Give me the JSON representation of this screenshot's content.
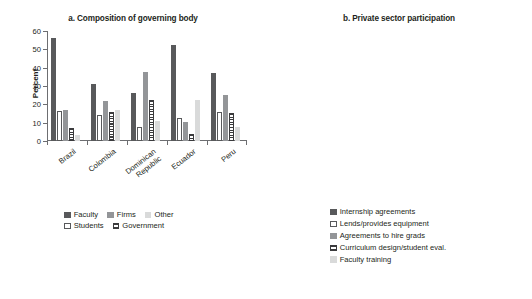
{
  "figure": {
    "panels": [
      {
        "id": "a",
        "title": "a. Composition of governing body",
        "ylabel": "Percent"
      },
      {
        "id": "b",
        "title": "b. Private sector participation",
        "ylabel": "Percent"
      }
    ]
  },
  "chart_data": [
    {
      "type": "bar",
      "title": "a. Composition of governing body",
      "xlabel": "",
      "ylabel": "Percent",
      "ylim": [
        0,
        60
      ],
      "yticks": [
        0,
        10,
        20,
        30,
        40,
        50,
        60
      ],
      "ytick_labels": [
        "0",
        "10",
        "20",
        "30",
        "40",
        "50",
        "60"
      ],
      "grid": false,
      "legend_position": "bottom",
      "categories": [
        "Brazil",
        "Colombia",
        "Dominican Republic",
        "Ecuador",
        "Peru"
      ],
      "category_lines": [
        [
          "Brazil"
        ],
        [
          "Colombia"
        ],
        [
          "Dominican",
          "Republic"
        ],
        [
          "Ecuador"
        ],
        [
          "Peru"
        ]
      ],
      "series": [
        {
          "name": "Faculty",
          "fill": "dark",
          "values": [
            56.0,
            31.0,
            26.0,
            52.2,
            37.0
          ]
        },
        {
          "name": "Students",
          "fill": "white",
          "values": [
            16.3,
            14.3,
            7.4,
            12.8,
            16.0
          ]
        },
        {
          "name": "Firms",
          "fill": "mid",
          "values": [
            16.9,
            22.0,
            37.8,
            10.4,
            25.2
          ]
        },
        {
          "name": "Government",
          "fill": "stripe",
          "values": [
            7.3,
            15.8,
            22.4,
            3.6,
            15.1
          ]
        },
        {
          "name": "Other",
          "fill": "light",
          "values": [
            3.5,
            16.7,
            11.0,
            22.2,
            7.7
          ]
        }
      ]
    },
    {
      "type": "bar",
      "title": "b. Private sector participation",
      "xlabel": "",
      "ylabel": "Percent",
      "ylim": [
        0,
        100
      ],
      "yticks": [
        0,
        20,
        40,
        60,
        80,
        100
      ],
      "ytick_labels": [
        "0",
        "20",
        "40",
        "60",
        "80",
        "100"
      ],
      "grid": false,
      "legend_position": "bottom",
      "categories": [
        "Brazil",
        "Colombia",
        "Dominican Republic",
        "Ecuador",
        "Peru"
      ],
      "category_lines": [
        [
          "Brazil"
        ],
        [
          "Colombia"
        ],
        [
          "Dominican",
          "Republic"
        ],
        [
          "Ecuador"
        ],
        [
          "Peru"
        ]
      ],
      "series": [
        {
          "name": "Internship agreements",
          "fill": "dark",
          "values": [
            81.3,
            92.5,
            93.6,
            94.4,
            91.2
          ]
        },
        {
          "name": "Lends/provides equipment",
          "fill": "white",
          "values": [
            39.2,
            52.5,
            34.6,
            51.9,
            53.6
          ]
        },
        {
          "name": "Agreements to hire grads",
          "fill": "mid",
          "values": [
            36.7,
            35.1,
            26.8,
            32.6,
            55.6
          ]
        },
        {
          "name": "Curriculum design/student eval.",
          "fill": "stripe",
          "values": [
            29.1,
            59.3,
            42.4,
            50.6,
            60.4
          ]
        },
        {
          "name": "Faculty training",
          "fill": "light",
          "values": [
            25.9,
            38.0,
            44.4,
            30.8,
            24.4
          ]
        }
      ]
    }
  ],
  "legends": {
    "a": {
      "row1": [
        {
          "label": "Faculty",
          "fill": "dark"
        },
        {
          "label": "Firms",
          "fill": "mid"
        },
        {
          "label": "Other",
          "fill": "light"
        }
      ],
      "row2": [
        {
          "label": "Students",
          "fill": "white"
        },
        {
          "label": "Government",
          "fill": "stripe"
        }
      ]
    },
    "b": {
      "rows": [
        {
          "label": "Internship agreements",
          "fill": "dark"
        },
        {
          "label": "Lends/provides equipment",
          "fill": "white"
        },
        {
          "label": "Agreements to hire grads",
          "fill": "mid"
        },
        {
          "label": "Curriculum design/student eval.",
          "fill": "stripe"
        },
        {
          "label": "Faculty training",
          "fill": "light"
        }
      ]
    }
  },
  "colors": {
    "dark": "#58595b",
    "white": "#ffffff",
    "mid": "#939598",
    "stripe": "#3b3b3d",
    "light": "#d9dada",
    "axis": "#6d6e71",
    "text": "#231f20"
  }
}
